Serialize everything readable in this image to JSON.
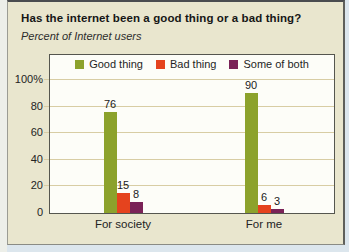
{
  "page": {
    "background_color": "#dce6ed",
    "left_edge_color": "#edefe9",
    "panel_color": "#e9e6ce"
  },
  "chart_data": {
    "type": "bar",
    "title": "Has the internet been a good thing or a bad thing?",
    "subtitle": "Percent of Internet users",
    "categories": [
      "For society",
      "For me"
    ],
    "series": [
      {
        "name": "Good thing",
        "color": "#8ca22c",
        "values": [
          76,
          90
        ]
      },
      {
        "name": "Bad thing",
        "color": "#e5431e",
        "values": [
          15,
          6
        ]
      },
      {
        "name": "Some of both",
        "color": "#7a2257",
        "values": [
          8,
          3
        ]
      }
    ],
    "y_ticks": [
      0,
      20,
      40,
      60,
      80,
      100
    ],
    "y_tick_labels": [
      "0",
      "20",
      "40",
      "60",
      "80",
      "100%"
    ],
    "ylim": [
      0,
      119
    ],
    "grid": true,
    "legend_position": "top-center",
    "value_labels_shown": true,
    "plot_background": "#fdfdf8",
    "gridline_color": "#d8cda4",
    "axis_border_color": "#55564f",
    "text_color": "#1b1b1b"
  }
}
